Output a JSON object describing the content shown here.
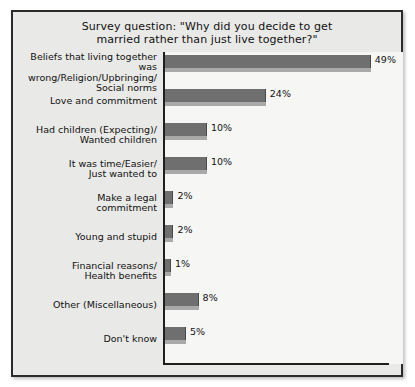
{
  "chart_data": {
    "type": "bar",
    "orientation": "horizontal",
    "title": "Survey question: \"Why did you decide to get\nmarried rather than just live together?\"",
    "xlabel": "",
    "ylabel": "",
    "xlim": [
      0,
      55
    ],
    "grid": false,
    "legend": null,
    "value_suffix": "%",
    "categories": [
      "Beliefs that living together was\nwrong/Religion/Upbringing/\nSocial norms",
      "Love and commitment",
      "Had children (Expecting)/\nWanted children",
      "It was time/Easier/\nJust wanted to",
      "Make a legal\ncommitment",
      "Young and stupid",
      "Financial reasons/\nHealth benefits",
      "Other (Miscellaneous)",
      "Don't know"
    ],
    "values": [
      49,
      24,
      10,
      10,
      2,
      2,
      1,
      8,
      5
    ],
    "value_labels": [
      "49%",
      "24%",
      "10%",
      "10%",
      "2%",
      "2%",
      "1%",
      "8%",
      "5%"
    ],
    "colors": {
      "bar_face": "#6f6f6f",
      "bar_shadow": "#a9a9a9",
      "plot_background": "#f6f6f4",
      "panel_background": "#e9e9e7",
      "axis": "#1f1f1f",
      "text": "#111111"
    }
  }
}
